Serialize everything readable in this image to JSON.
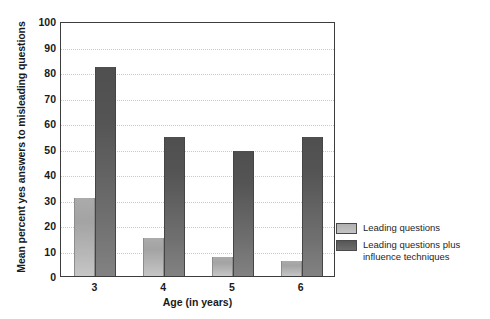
{
  "chart_data": {
    "type": "bar",
    "title": "",
    "xlabel": "Age (in years)",
    "ylabel": "Mean percent yes answers to misleading questions",
    "categories": [
      "3",
      "4",
      "5",
      "6"
    ],
    "ylim": [
      0,
      100
    ],
    "yticks": [
      0,
      10,
      20,
      30,
      40,
      50,
      60,
      70,
      80,
      90,
      100
    ],
    "grid": true,
    "legend_position": "right",
    "series": [
      {
        "name": "Leading questions",
        "color": "#b4b4b4",
        "values": [
          30.5,
          15,
          7.5,
          6
        ]
      },
      {
        "name": "Leading questions plus\ninfluence techniques",
        "color": "#5e5e5e",
        "values": [
          82,
          54.5,
          49,
          54.5
        ]
      }
    ]
  },
  "legend": {
    "items": [
      {
        "label": "Leading questions"
      },
      {
        "label": "Leading questions plus\ninfluence techniques"
      }
    ]
  },
  "colors": {
    "frame": "#3d3d3d",
    "gridline": "#c9c9c9",
    "background": "#ffffff",
    "light_bar": "#b4b4b4",
    "dark_bar": "#5e5e5e"
  }
}
